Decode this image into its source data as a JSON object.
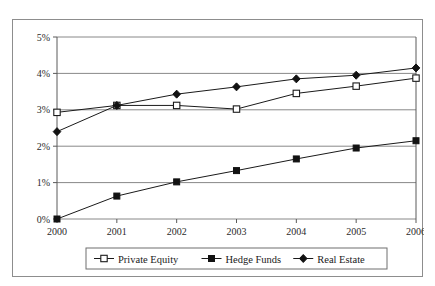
{
  "chart_data": {
    "type": "line",
    "title": "",
    "subtitle": "",
    "xlabel": "",
    "ylabel": "",
    "categories": [
      "2000",
      "2001",
      "2002",
      "2003",
      "2004",
      "2005",
      "2006"
    ],
    "x": [
      2000,
      2001,
      2002,
      2003,
      2004,
      2005,
      2006
    ],
    "xlim": [
      2000,
      2006
    ],
    "ylim": [
      0,
      5
    ],
    "y_tick_labels": [
      "0%",
      "1%",
      "2%",
      "3%",
      "4%",
      "5%"
    ],
    "y_tick_values": [
      0,
      1,
      2,
      3,
      4,
      5
    ],
    "y_unit": "%",
    "grid": "horizontal",
    "legend_position": "bottom-center",
    "series": [
      {
        "name": "Private Equity",
        "marker": "open-square",
        "values": [
          2.93,
          3.12,
          3.12,
          3.02,
          3.45,
          3.65,
          3.87
        ]
      },
      {
        "name": "Hedge Funds",
        "marker": "filled-square",
        "values": [
          0.0,
          0.63,
          1.02,
          1.33,
          1.65,
          1.95,
          2.15
        ]
      },
      {
        "name": "Real Estate",
        "marker": "filled-diamond",
        "values": [
          2.4,
          3.12,
          3.43,
          3.63,
          3.85,
          3.95,
          4.15
        ]
      }
    ],
    "colors": {
      "line": "#1a1a1a",
      "grid": "#7a7a7a",
      "axis": "#5a5a5a",
      "border": "#8d8d8d",
      "background": "#ffffff"
    }
  },
  "axis": {
    "y_ticks": [
      {
        "label": "5%"
      },
      {
        "label": "4%"
      },
      {
        "label": "3%"
      },
      {
        "label": "2%"
      },
      {
        "label": "1%"
      },
      {
        "label": "0%"
      }
    ],
    "x_ticks": [
      {
        "label": "2000"
      },
      {
        "label": "2001"
      },
      {
        "label": "2002"
      },
      {
        "label": "2003"
      },
      {
        "label": "2004"
      },
      {
        "label": "2005"
      },
      {
        "label": "2006"
      }
    ]
  },
  "legend": {
    "items": [
      {
        "label": "Private Equity",
        "marker": "open-square"
      },
      {
        "label": "Hedge Funds",
        "marker": "filled-square"
      },
      {
        "label": "Real Estate",
        "marker": "filled-diamond"
      }
    ]
  }
}
